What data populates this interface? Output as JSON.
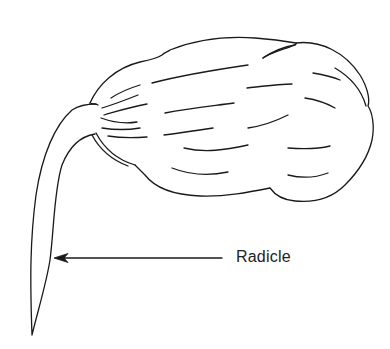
{
  "diagram": {
    "labels": [
      {
        "text": "Radicle",
        "points_to": "radicle"
      }
    ],
    "colors": {
      "ink": "#1a1a1a",
      "background": "#ffffff"
    }
  }
}
